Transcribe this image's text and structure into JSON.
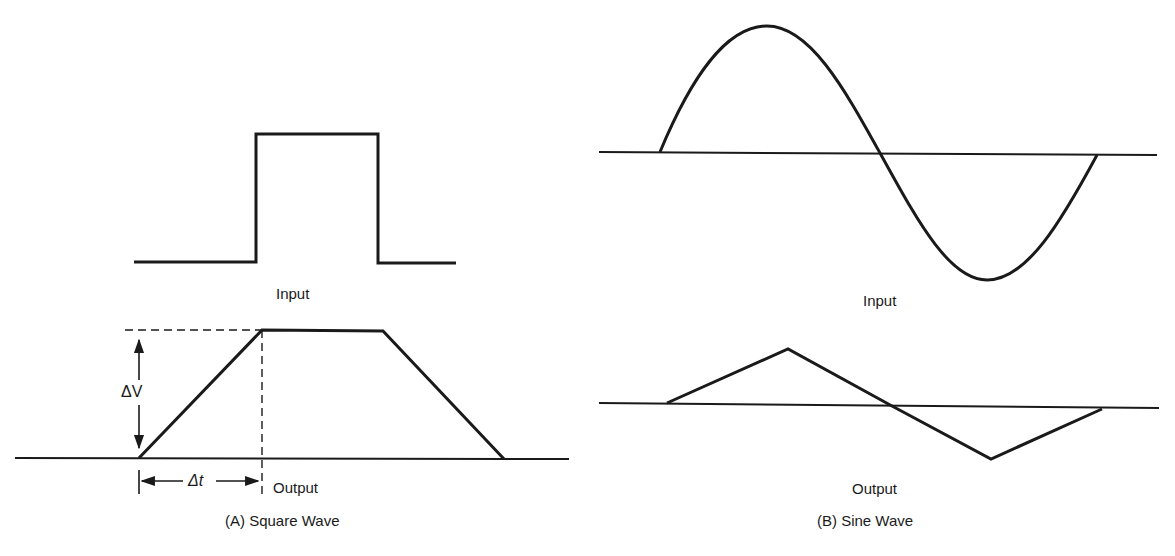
{
  "panel_a": {
    "caption": "(A) Square Wave",
    "input_label": "Input",
    "output_label": "Output",
    "delta_v_label": "ΔV",
    "delta_t_label": "Δt",
    "input_shape": "square-pulse",
    "output_shape": "trapezoid"
  },
  "panel_b": {
    "caption": "(B) Sine Wave",
    "input_label": "Input",
    "output_label": "Output",
    "input_shape": "sine-one-cycle",
    "output_shape": "triangle-one-cycle"
  },
  "colors": {
    "ink": "#1a1a1a",
    "background": "#ffffff"
  }
}
